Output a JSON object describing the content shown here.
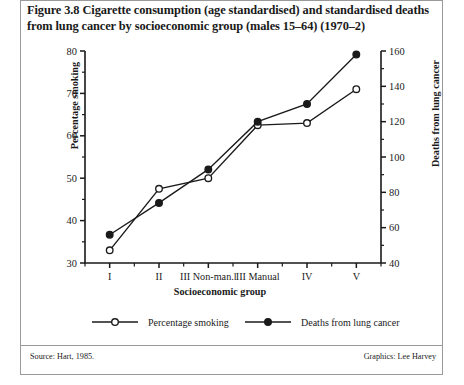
{
  "figure": {
    "title": "Figure 3.8 Cigarette consumption (age standardised) and standardised deaths from lung cancer by socioeconomic group (males 15–64) (1970–2)",
    "source": "Source: Hart, 1985.",
    "graphics": "Graphics: Lee Harvey"
  },
  "legend": {
    "items": [
      {
        "label": "Percentage smoking",
        "marker": "open-circle-icon"
      },
      {
        "label": "Deaths from lung cancer",
        "marker": "filled-circle-icon"
      }
    ]
  },
  "axes": {
    "left": {
      "title": "Percentage smoking",
      "ticks": [
        "30",
        "40",
        "50",
        "60",
        "70",
        "80"
      ],
      "min": 30,
      "max": 80,
      "step": 10
    },
    "right": {
      "title": "Deaths from lung cancer",
      "ticks": [
        "40",
        "60",
        "80",
        "100",
        "120",
        "140",
        "160"
      ],
      "min": 40,
      "max": 160,
      "step": 20,
      "minor_step": 10
    },
    "x": {
      "title": "Socioeconomic group"
    }
  },
  "chart_data": {
    "type": "line",
    "title": "Figure 3.8 Cigarette consumption (age standardised) and standardised deaths from lung cancer by socioeconomic group (males 15–64) (1970–2)",
    "xlabel": "Socioeconomic group",
    "ylabel": "Percentage smoking",
    "y2label": "Deaths from lung cancer",
    "categories": [
      "I",
      "II",
      "III Non-man.l",
      "III Manual",
      "IV",
      "V"
    ],
    "ylim": [
      30,
      80
    ],
    "y2lim": [
      40,
      160
    ],
    "grid": false,
    "legend_position": "bottom",
    "series": [
      {
        "name": "Percentage smoking",
        "axis": "left",
        "marker": "open-circle",
        "values": [
          33,
          47.5,
          50,
          62.5,
          63,
          71
        ]
      },
      {
        "name": "Deaths from lung cancer",
        "axis": "right",
        "marker": "filled-circle",
        "values": [
          56,
          74,
          93,
          120,
          130,
          158
        ]
      }
    ]
  },
  "colors": {
    "ink": "#1a1a1a",
    "frame": "#9a9a9a",
    "background": "#ffffff"
  }
}
